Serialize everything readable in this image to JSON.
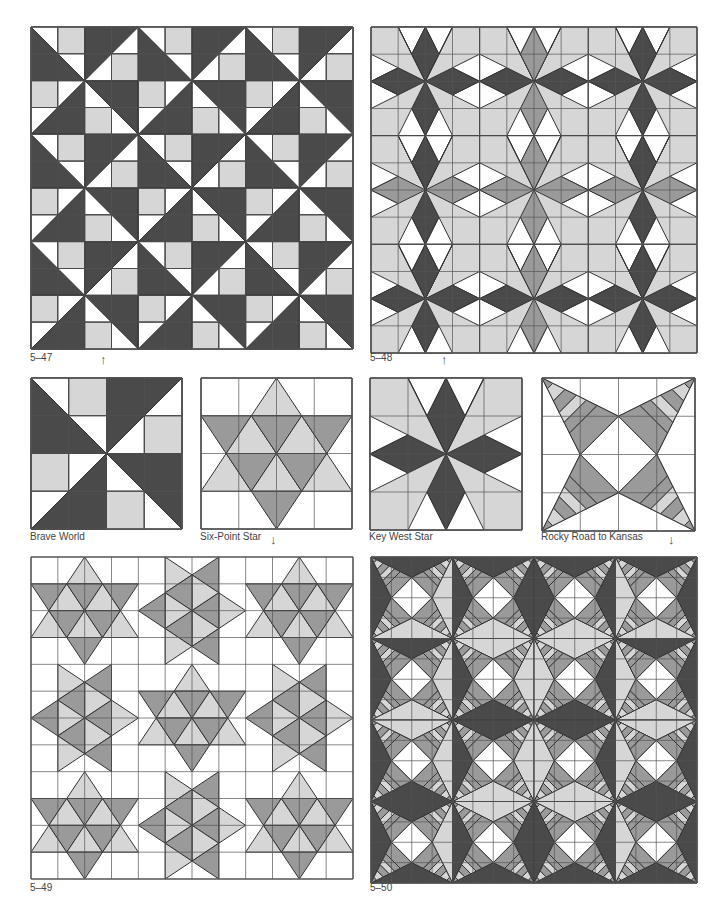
{
  "colors": {
    "dark": "#4a4a4a",
    "medium": "#9a9a9a",
    "light": "#d6d6d6",
    "white": "#ffffff",
    "line": "#333333",
    "grid": "#555555"
  },
  "figures": [
    {
      "id": "fig-5-47",
      "label": "5–47",
      "type": "brave-world-quilt",
      "x": 30,
      "y": 26,
      "size": 322,
      "blocks": 3,
      "label_x": 30,
      "label_y": 352
    },
    {
      "id": "fig-5-48",
      "label": "5–48",
      "type": "key-west-quilt",
      "x": 370,
      "y": 26,
      "size": 326,
      "blocks": 3,
      "label_x": 370,
      "label_y": 352
    },
    {
      "id": "fig-5-49",
      "label": "5–49",
      "type": "six-point-quilt",
      "x": 30,
      "y": 556,
      "size": 322,
      "blocks": 3,
      "label_x": 30,
      "label_y": 882
    },
    {
      "id": "fig-5-50",
      "label": "5–50",
      "type": "rocky-road-quilt",
      "x": 370,
      "y": 556,
      "size": 326,
      "blocks": 4,
      "label_x": 370,
      "label_y": 882
    }
  ],
  "blocks": [
    {
      "id": "brave-world",
      "name": "Brave World",
      "type": "brave-world",
      "x": 30,
      "y": 377,
      "size": 151,
      "label_x": 30,
      "label_y": 531
    },
    {
      "id": "six-point-star",
      "name": "Six-Point Star",
      "type": "six-point",
      "x": 200,
      "y": 377,
      "size": 151,
      "label_x": 200,
      "label_y": 531
    },
    {
      "id": "key-west-star",
      "name": "Key West Star",
      "type": "key-west",
      "x": 369,
      "y": 377,
      "size": 152,
      "label_x": 369,
      "label_y": 531
    },
    {
      "id": "rocky-road-to-kansas",
      "name": "Rocky Road to Kansas",
      "type": "rocky-road",
      "x": 541,
      "y": 377,
      "size": 153,
      "label_x": 541,
      "label_y": 531
    }
  ],
  "arrows": [
    {
      "id": "arrow-up-5-47",
      "glyph": "↑",
      "x": 100,
      "y": 353
    },
    {
      "id": "arrow-up-5-48",
      "glyph": "↑",
      "x": 441,
      "y": 353
    },
    {
      "id": "arrow-down-six-point",
      "glyph": "↓",
      "x": 270,
      "y": 533
    },
    {
      "id": "arrow-down-rocky-road",
      "glyph": "↓",
      "x": 668,
      "y": 533
    }
  ]
}
